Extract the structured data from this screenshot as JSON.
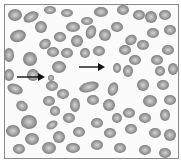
{
  "figure": {
    "cell_color": "#8f8f8f",
    "cell_center_color": "#c8c8c8",
    "arrow_color": "#111111",
    "arrows": [
      {
        "x1": 14,
        "y1": 72,
        "x2": 40,
        "y2": 72,
        "label": "arrow-left"
      },
      {
        "x1": 74,
        "y1": 62,
        "x2": 100,
        "y2": 62,
        "label": "arrow-center"
      }
    ]
  }
}
